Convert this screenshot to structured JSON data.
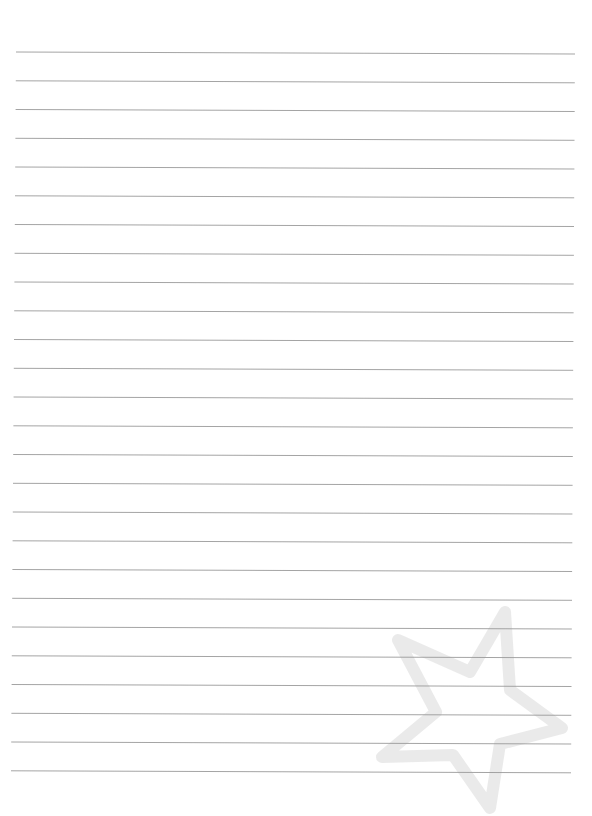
{
  "page": {
    "type": "lined-paper",
    "background_color": "#ffffff",
    "rule_color": "#9a9a9a",
    "rule_count": 26,
    "first_rule_y": 52,
    "rule_spacing": 28.75,
    "rule_left_x_top": 16,
    "rule_left_x_bottom": 11,
    "rule_right_x_top": 575,
    "rule_right_x_bottom": 571,
    "rule_tilt_px": 2
  },
  "watermark": {
    "icon": "star-outline-icon",
    "color": "#e6e6e6",
    "opacity": 0.85
  }
}
